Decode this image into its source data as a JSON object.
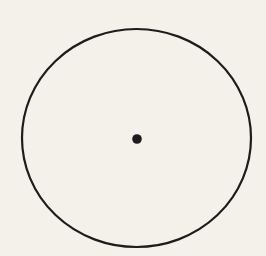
{
  "figure": {
    "background_color": "#f3f1e9",
    "stroke_color": "#1c1c1c",
    "circle": {
      "cx": 136.5,
      "cy": 138,
      "rx": 114.5,
      "ry": 109,
      "stroke_width": 2.2
    },
    "center_point": {
      "cx": 137,
      "cy": 139,
      "r": 4.8
    }
  }
}
